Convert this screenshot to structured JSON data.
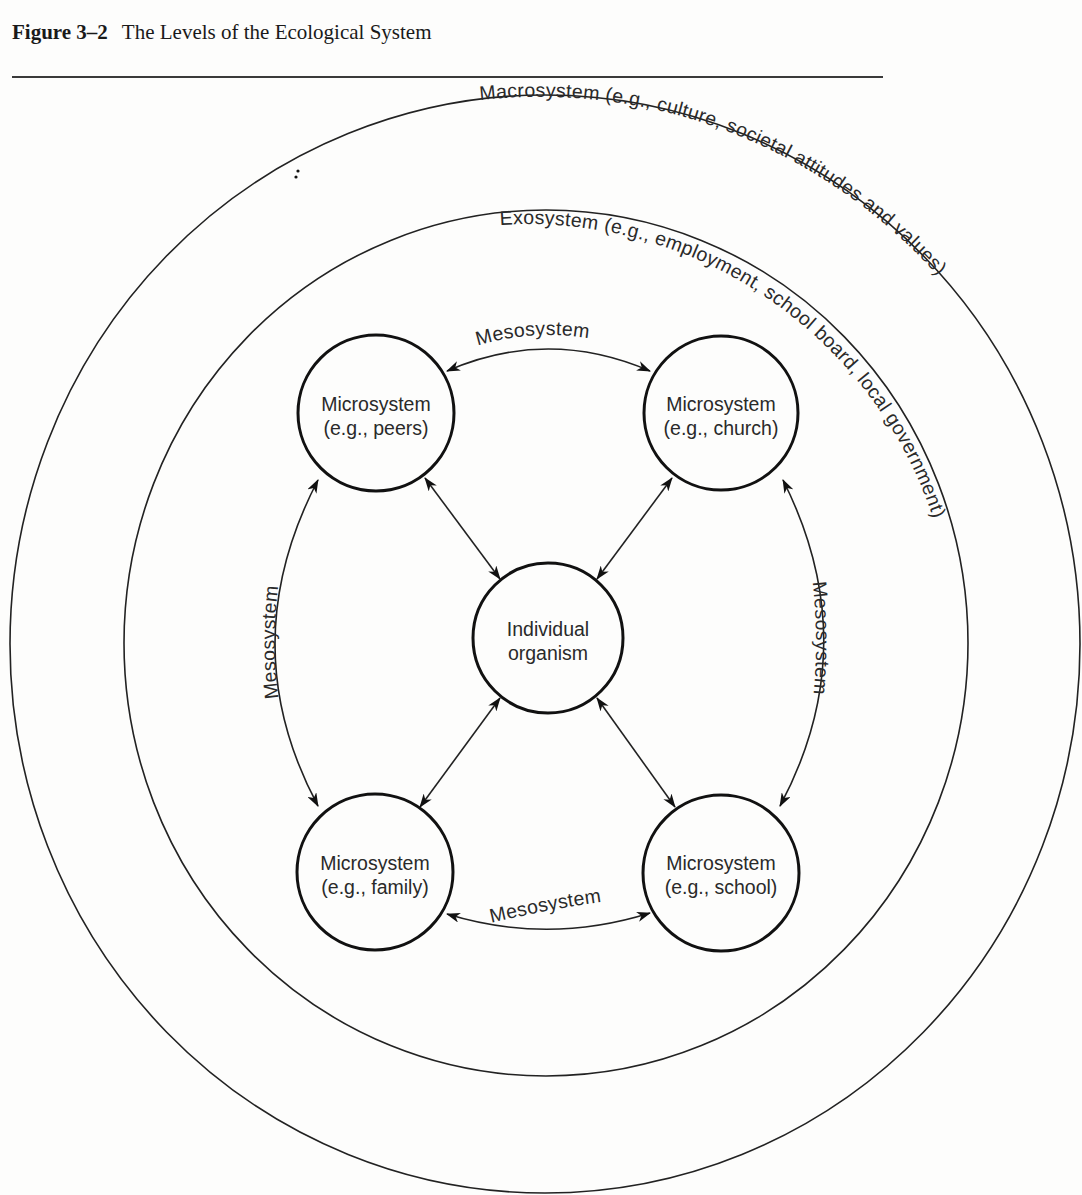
{
  "caption": {
    "figure_label": "Figure 3–2",
    "title": "The Levels of the Ecological System"
  },
  "rings": {
    "macrosystem": "Macrosystem  (e.g., culture, societal attitudes and values)",
    "exosystem": "Exosystem  (e.g.,  employment, school board, local government)"
  },
  "center": {
    "line1": "Individual",
    "line2": "organism"
  },
  "microsystems": {
    "peers": {
      "line1": "Microsystem",
      "line2": "(e.g., peers)"
    },
    "church": {
      "line1": "Microsystem",
      "line2": "(e.g., church)"
    },
    "family": {
      "line1": "Microsystem",
      "line2": "(e.g., family)"
    },
    "school": {
      "line1": "Microsystem",
      "line2": "(e.g., school)"
    }
  },
  "mesosystem_links": {
    "top": "Mesosystem",
    "bottom": "Mesosystem",
    "left": "Mesosystem",
    "right": "Mesosystem"
  },
  "colors": {
    "ink": "#1c1c1c",
    "paper": "#fdfdfc"
  }
}
